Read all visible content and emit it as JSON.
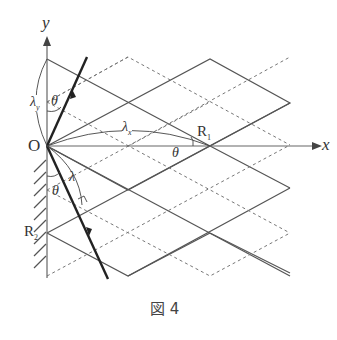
{
  "figure": {
    "caption": "図 4",
    "axes": {
      "x_label": "x",
      "y_label": "y",
      "origin_label": "O"
    },
    "points": {
      "R1": "R",
      "R1_sub": "1",
      "R2": "R",
      "R2_sub": "2"
    },
    "annotations": {
      "lambda_y": "λ",
      "lambda_y_sub": "y",
      "lambda_x": "λ",
      "lambda_x_sub": "x",
      "lambda": "λ",
      "theta_top": "θ",
      "theta_r1": "θ",
      "theta_bottom": "θ"
    },
    "colors": {
      "solid_line": "#555555",
      "dashed_line": "#777777",
      "ray": "#222222",
      "axis": "#666666"
    }
  }
}
